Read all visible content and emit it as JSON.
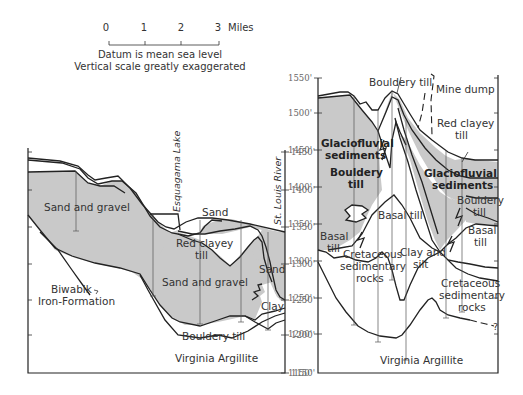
{
  "scale_bar": {
    "ticks": [
      "0",
      "1",
      "2",
      "3"
    ],
    "unit": "Miles",
    "note_1": "Datum is mean sea level",
    "note_2": "Vertical scale greatly exaggerated"
  },
  "left_section": {
    "axis": {
      "side": "right",
      "labels": [
        "1450'",
        "1400'",
        "1350'",
        "1300'",
        "1250'",
        "1200'",
        "1150'"
      ]
    },
    "places": {
      "lake": "Esquagama Lake",
      "river": "St. Louis River"
    },
    "units": {
      "sand_gravel_upper": "Sand and gravel",
      "sand_upper": "Sand",
      "sand_right": "Sand",
      "red_clayey_till_1": "Red clayey",
      "red_clayey_till_2": "till",
      "sand_gravel_lower": "Sand and gravel",
      "clay": "Clay",
      "bouldery_till": "Bouldery till",
      "virginia_argillite": "Virginia Argillite",
      "biwabik_1": "Biwabik",
      "biwabik_2": "Iron-Formation"
    }
  },
  "right_section": {
    "axis": {
      "side": "left",
      "labels": [
        "1550'",
        "1500'",
        "1450'",
        "1400'",
        "1350'",
        "1300'",
        "1250'",
        "1200'",
        "1150'"
      ]
    },
    "units": {
      "bouldery_till_top": "Bouldery till",
      "mine_dump": "Mine dump",
      "red_clayey_1": "Red clayey",
      "red_clayey_2": "till",
      "glacio_left_1": "Glaciofluvial",
      "glacio_left_2": "sediments",
      "bouldery_left_1": "Bouldery",
      "bouldery_left_2": "till",
      "glacio_right_1": "Glaciofluvial",
      "glacio_right_2": "sediments",
      "bouldery_right_1": "Bouldery",
      "bouldery_right_2": "till",
      "basal_till_center": "Basal till",
      "basal_left_1": "Basal",
      "basal_left_2": "till",
      "basal_right_1": "Basal",
      "basal_right_2": "till",
      "cret_left_1": "Cretaceous",
      "cret_left_2": "sedimentary",
      "cret_left_3": "rocks",
      "clay_silt_1": "Clay and",
      "clay_silt_2": "silt",
      "cret_right_1": "Cretaceous",
      "cret_right_2": "sedimentary",
      "cret_right_3": "rocks",
      "virginia_argillite": "Virginia Argillite",
      "query": "?"
    }
  },
  "colors": {
    "sediment_fill": "#c9c9c9",
    "line": "#222222",
    "background": "#ffffff"
  }
}
